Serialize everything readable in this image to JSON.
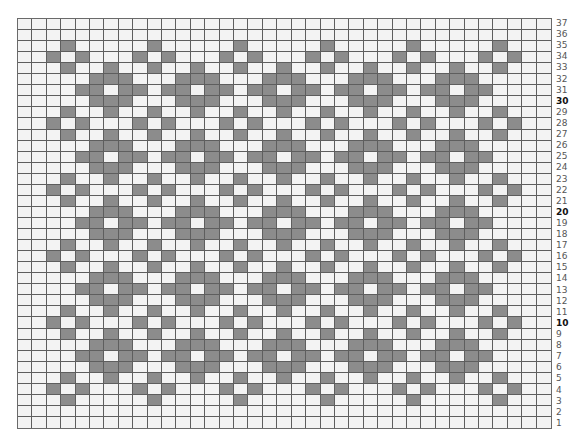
{
  "chart_title": "",
  "grid": {
    "columns": 37,
    "rows": 37,
    "colors": {
      "filled": "#8c8c8c",
      "empty": "#f3f3f3",
      "gridline": "#5e5e5e",
      "label": "#555555",
      "label_bold": "#111111"
    },
    "row_patterns": {
      "blank": [],
      "cap": [
        3,
        9,
        15,
        21,
        27,
        33
      ],
      "x": [
        2,
        4,
        8,
        10,
        14,
        16,
        20,
        22,
        26,
        28,
        32,
        34
      ],
      "t": [
        3,
        6,
        9,
        12,
        15,
        18,
        21,
        24,
        27,
        30,
        33
      ],
      "m": [
        5,
        6,
        7,
        11,
        12,
        13,
        17,
        18,
        19,
        23,
        24,
        25,
        29,
        30,
        31
      ],
      "d": [
        4,
        5,
        7,
        8,
        10,
        11,
        13,
        14,
        16,
        17,
        19,
        20,
        22,
        23,
        25,
        26,
        28,
        29,
        31,
        32
      ]
    },
    "rows_top_to_bottom": [
      {
        "label": "37",
        "bold": false,
        "pattern": "blank"
      },
      {
        "label": "36",
        "bold": false,
        "pattern": "blank"
      },
      {
        "label": "35",
        "bold": false,
        "pattern": "cap"
      },
      {
        "label": "34",
        "bold": false,
        "pattern": "x"
      },
      {
        "label": "33",
        "bold": false,
        "pattern": "t"
      },
      {
        "label": "32",
        "bold": false,
        "pattern": "m"
      },
      {
        "label": "31",
        "bold": false,
        "pattern": "d"
      },
      {
        "label": "30",
        "bold": true,
        "pattern": "m"
      },
      {
        "label": "29",
        "bold": false,
        "pattern": "t"
      },
      {
        "label": "28",
        "bold": false,
        "pattern": "x"
      },
      {
        "label": "27",
        "bold": false,
        "pattern": "t"
      },
      {
        "label": "26",
        "bold": false,
        "pattern": "m"
      },
      {
        "label": "25",
        "bold": false,
        "pattern": "d"
      },
      {
        "label": "24",
        "bold": false,
        "pattern": "m"
      },
      {
        "label": "23",
        "bold": false,
        "pattern": "t"
      },
      {
        "label": "22",
        "bold": false,
        "pattern": "x"
      },
      {
        "label": "21",
        "bold": false,
        "pattern": "t"
      },
      {
        "label": "20",
        "bold": true,
        "pattern": "m"
      },
      {
        "label": "19",
        "bold": false,
        "pattern": "d"
      },
      {
        "label": "18",
        "bold": false,
        "pattern": "m"
      },
      {
        "label": "17",
        "bold": false,
        "pattern": "t"
      },
      {
        "label": "16",
        "bold": false,
        "pattern": "x"
      },
      {
        "label": "15",
        "bold": false,
        "pattern": "t"
      },
      {
        "label": "14",
        "bold": false,
        "pattern": "m"
      },
      {
        "label": "13",
        "bold": false,
        "pattern": "d"
      },
      {
        "label": "12",
        "bold": false,
        "pattern": "m"
      },
      {
        "label": "11",
        "bold": false,
        "pattern": "t"
      },
      {
        "label": "10",
        "bold": true,
        "pattern": "x"
      },
      {
        "label": "9",
        "bold": false,
        "pattern": "t"
      },
      {
        "label": "8",
        "bold": false,
        "pattern": "m"
      },
      {
        "label": "7",
        "bold": false,
        "pattern": "d"
      },
      {
        "label": "6",
        "bold": false,
        "pattern": "m"
      },
      {
        "label": "5",
        "bold": false,
        "pattern": "t"
      },
      {
        "label": "4",
        "bold": false,
        "pattern": "x"
      },
      {
        "label": "3",
        "bold": false,
        "pattern": "cap"
      },
      {
        "label": "2",
        "bold": false,
        "pattern": "blank"
      },
      {
        "label": "1",
        "bold": false,
        "pattern": "blank"
      }
    ]
  }
}
